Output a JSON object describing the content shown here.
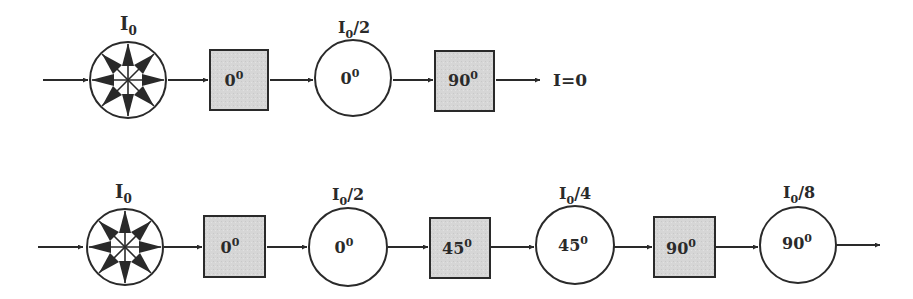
{
  "colors": {
    "stroke": "#2a2a2a",
    "filter_fill": "#d9d9d9",
    "background": "#ffffff"
  },
  "row1": {
    "source": {
      "label": "I",
      "sub": "0",
      "icon": "unpolarized-light-icon"
    },
    "filter1": {
      "angle": "0",
      "sup": "0"
    },
    "state1": {
      "intensity_label": "I",
      "intensity_sub": "0",
      "intensity_rest": "/2",
      "angle": "0",
      "sup": "0"
    },
    "filter2": {
      "angle": "90",
      "sup": "0"
    },
    "output": {
      "label": "I=0"
    }
  },
  "row2": {
    "source": {
      "label": "I",
      "sub": "0",
      "icon": "unpolarized-light-icon"
    },
    "filter1": {
      "angle": "0",
      "sup": "0"
    },
    "state1": {
      "intensity_label": "I",
      "intensity_sub": "0",
      "intensity_rest": "/2",
      "angle": "0",
      "sup": "0"
    },
    "filter2": {
      "angle": "45",
      "sup": "0"
    },
    "state2": {
      "intensity_label": "I",
      "intensity_sub": "0",
      "intensity_rest": "/4",
      "angle": "45",
      "sup": "0"
    },
    "filter3": {
      "angle": "90",
      "sup": "0"
    },
    "state3": {
      "intensity_label": "I",
      "intensity_sub": "0",
      "intensity_rest": "/8",
      "angle": "90",
      "sup": "0"
    }
  }
}
